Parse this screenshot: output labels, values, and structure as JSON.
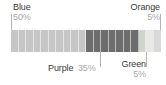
{
  "chart_data": {
    "type": "bar",
    "title": "",
    "subtitle": "",
    "xlabel": "",
    "ylabel": "",
    "orientation": "horizontal",
    "stacked": true,
    "grid": false,
    "legend_position": "callout-labels",
    "xlim": [
      0,
      100
    ],
    "unit": "%",
    "cell_step": 5,
    "categories": [
      "Blue",
      "Purple",
      "Green",
      "Orange"
    ],
    "values": [
      50,
      35,
      5,
      5
    ],
    "series": [
      {
        "name": "Share",
        "values": [
          50,
          35,
          5,
          5
        ]
      }
    ],
    "segments": [
      {
        "label": "Blue",
        "value": 50,
        "value_text": "50%",
        "color": "#c6c6c6",
        "cells": 10,
        "label_position": "top-left",
        "leader": true
      },
      {
        "label": "Purple",
        "value": 35,
        "value_text": "35%",
        "color": "#6d6d6d",
        "cells": 7,
        "label_position": "bottom",
        "leader": true
      },
      {
        "label": "Green",
        "value": 5,
        "value_text": "5%",
        "color": "#cfd4cc",
        "cells": 1,
        "label_position": "bottom-right",
        "leader": true
      },
      {
        "label": "Orange",
        "value": 5,
        "value_text": "5%",
        "color": "#e8e8e6",
        "cells": 1,
        "label_position": "top-right",
        "leader": true
      }
    ]
  },
  "labels": {
    "blue": {
      "name": "Blue",
      "percent": "50%"
    },
    "orange": {
      "name": "Orange",
      "percent": "5%"
    },
    "purple": {
      "name": "Purple",
      "percent": "35%"
    },
    "green": {
      "name": "Green",
      "percent": "5%"
    }
  },
  "colors": {
    "background": "#ffffff",
    "label_text": "#3a3a3a",
    "percent_text": "#a8a8a8",
    "leader_line": "#b4b4b4",
    "blue_segment": "#c6c6c6",
    "purple_segment": "#6d6d6d",
    "green_segment": "#cfd4cc",
    "orange_segment": "#e8e8e6"
  }
}
